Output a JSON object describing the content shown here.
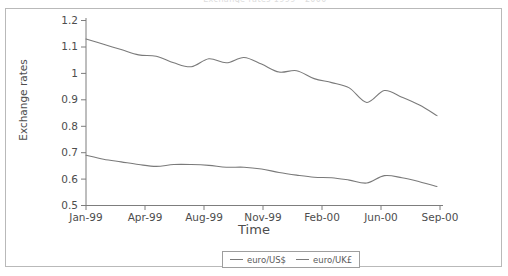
{
  "figure": {
    "top_cut_title": "Exchange rates 1999 - 2000",
    "xlabel": "Time",
    "ylabel": "Exchange rates"
  },
  "axis": {
    "y_ticks": [
      "1.2",
      "1.1",
      "1",
      "0.9",
      "0.8",
      "0.7",
      "0.6",
      "0.5"
    ],
    "x_ticks": [
      "Jan-99",
      "Apr-99",
      "Aug-99",
      "Nov-99",
      "Feb-00",
      "Jun-00",
      "Sep-00"
    ]
  },
  "legend": {
    "items": [
      {
        "label": "euro/US$",
        "color": "#7a7a7a"
      },
      {
        "label": "euro/UK£",
        "color": "#7a7a7a"
      }
    ]
  },
  "chart_data": {
    "type": "line",
    "title": "Exchange rates 1999 - 2000",
    "xlabel": "Time",
    "ylabel": "Exchange rates",
    "ylim": [
      0.5,
      1.2
    ],
    "yticks": [
      0.5,
      0.6,
      0.7,
      0.8,
      0.9,
      1.0,
      1.1,
      1.2
    ],
    "grid": false,
    "legend_position": "bottom-center",
    "x_tick_labels": [
      "Jan-99",
      "Apr-99",
      "Aug-99",
      "Nov-99",
      "Feb-00",
      "Jun-00",
      "Sep-00"
    ],
    "x": [
      "Jan-99",
      "Feb-99",
      "Mar-99",
      "Apr-99",
      "May-99",
      "Jun-99",
      "Jul-99",
      "Aug-99",
      "Sep-99",
      "Oct-99",
      "Nov-99",
      "Dec-99",
      "Jan-00",
      "Feb-00",
      "Mar-00",
      "Apr-00",
      "May-00",
      "Jun-00",
      "Jul-00",
      "Aug-00",
      "Sep-00"
    ],
    "series": [
      {
        "name": "euro/US$",
        "color": "#7a7a7a",
        "values": [
          1.13,
          1.11,
          1.09,
          1.07,
          1.065,
          1.04,
          1.025,
          1.055,
          1.04,
          1.06,
          1.035,
          1.005,
          1.01,
          0.98,
          0.965,
          0.945,
          0.89,
          0.935,
          0.91,
          0.88,
          0.84
        ]
      },
      {
        "name": "euro/UK£",
        "color": "#7a7a7a",
        "values": [
          0.69,
          0.675,
          0.665,
          0.655,
          0.648,
          0.655,
          0.655,
          0.652,
          0.645,
          0.645,
          0.638,
          0.625,
          0.615,
          0.607,
          0.605,
          0.596,
          0.585,
          0.613,
          0.605,
          0.59,
          0.572
        ]
      }
    ]
  }
}
